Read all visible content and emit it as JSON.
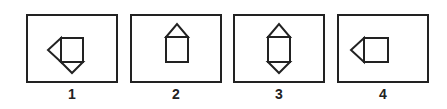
{
  "options": [
    {
      "label": "1",
      "figure": "square-with-left-triangle-and-bottom-triangle"
    },
    {
      "label": "2",
      "figure": "square-with-top-triangle"
    },
    {
      "label": "3",
      "figure": "square-with-top-and-bottom-triangles"
    },
    {
      "label": "4",
      "figure": "square-with-left-triangle"
    }
  ],
  "colors": {
    "stroke": "#222222",
    "background": "#ffffff"
  }
}
